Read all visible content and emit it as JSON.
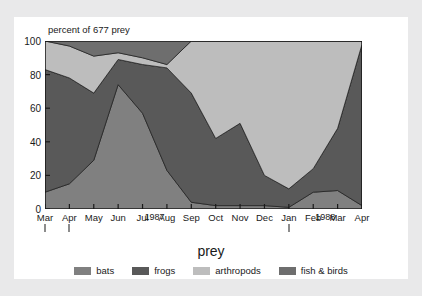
{
  "figure": {
    "background": "#ffffff",
    "page_background": "#e9e9ea"
  },
  "chart_data": {
    "type": "area",
    "title": "percent of 677 prey",
    "xlabel": "prey",
    "ylabel": "",
    "ylim": [
      0,
      100
    ],
    "yticks": [
      0,
      20,
      40,
      60,
      80,
      100
    ],
    "grid": true,
    "stacked": true,
    "legend_position": "bottom",
    "categories": [
      "Mar",
      "Apr",
      "May",
      "Jun",
      "Jul",
      "Aug",
      "Sep",
      "Oct",
      "Nov",
      "Dec",
      "Jan",
      "Feb",
      "Mar",
      "Apr"
    ],
    "year_markers": [
      {
        "label": "1987",
        "at_category": "Jul"
      },
      {
        "label": "1988",
        "at_category": "Feb"
      }
    ],
    "year_ticks": [
      "Mar",
      "Jan",
      "Apr"
    ],
    "series": [
      {
        "name": "bats",
        "color": "#808080",
        "values": [
          10,
          15,
          29,
          74,
          57,
          23,
          4,
          2,
          2,
          2,
          1,
          10,
          11,
          2
        ]
      },
      {
        "name": "frogs",
        "color": "#595959",
        "values": [
          73,
          63,
          40,
          15,
          29,
          61,
          65,
          40,
          49,
          18,
          11,
          14,
          37,
          96
        ]
      },
      {
        "name": "arthropods",
        "color": "#bdbdbd",
        "values": [
          17,
          19,
          22,
          4,
          4,
          2,
          31,
          58,
          49,
          80,
          88,
          76,
          52,
          2
        ]
      },
      {
        "name": "fish & birds",
        "color": "#6e6e6e",
        "values": [
          0,
          3,
          9,
          7,
          10,
          14,
          0,
          0,
          0,
          0,
          0,
          0,
          0,
          0
        ]
      }
    ],
    "legend": [
      {
        "label": "bats",
        "color": "#808080"
      },
      {
        "label": "frogs",
        "color": "#595959"
      },
      {
        "label": "arthropods",
        "color": "#bdbdbd"
      },
      {
        "label": "fish & birds",
        "color": "#6e6e6e"
      }
    ]
  }
}
